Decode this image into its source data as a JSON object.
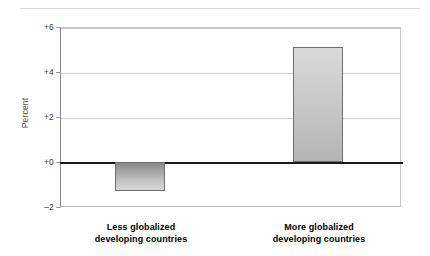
{
  "chart_data": {
    "type": "bar",
    "title": "",
    "subtitle": "",
    "xlabel": "",
    "ylabel": "Percent",
    "categories": [
      "Less globalized developing countries",
      "More globalized developing countries"
    ],
    "category_lines": [
      [
        "Less globalized",
        "developing countries"
      ],
      [
        "More globalized",
        "developing countries"
      ]
    ],
    "values": [
      -1.3,
      5.1
    ],
    "ylim": [
      -2,
      6
    ],
    "yticks": [
      6,
      4,
      2,
      0,
      -2
    ],
    "ytick_labels": [
      "+6",
      "+4",
      "+2",
      "+0",
      "–2"
    ],
    "grid": true,
    "gridlines_at": [
      6,
      4,
      2
    ],
    "zero_line": true,
    "legend": "none",
    "colors": {
      "bar_negative_top": "#888888",
      "bar_negative_bottom": "#d6d6d6",
      "bar_positive_top": "#dadada",
      "bar_positive_bottom": "#b4b4b4",
      "bar_border": "#6e6e6e",
      "gridline": "#cfcfcf",
      "zero_line": "#1a1a1a",
      "axis": "#8a8a8a",
      "text": "#000000",
      "tick_text": "#3c3c3c",
      "axis_title": "#4a4a4a",
      "background": "#ffffff",
      "top_rule": "#d8d8d8"
    }
  }
}
